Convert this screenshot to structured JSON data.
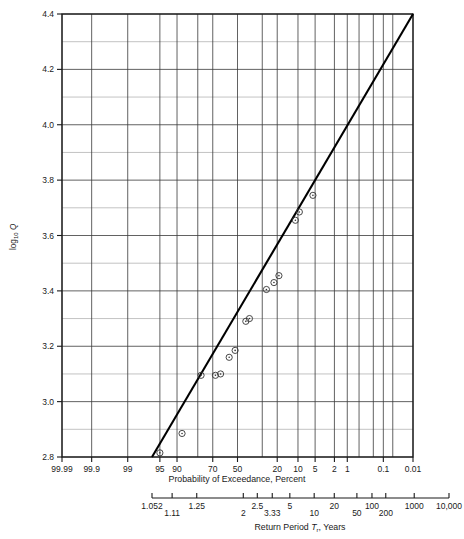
{
  "chart_data": {
    "type": "scatter",
    "title": "",
    "subtitle": "",
    "xlabel": "Probability of Exceedance, Percent",
    "xlabel2": "Return Period T_r, Years",
    "ylabel": "log10 Q",
    "ylabel_base": "log",
    "ylabel_sub": "10",
    "ylabel_var": "Q",
    "grid": true,
    "legend": null,
    "ylim": [
      2.8,
      4.4
    ],
    "y_major_ticks": [
      "2.8",
      "3.0",
      "3.2",
      "3.4",
      "3.6",
      "3.8",
      "4.0",
      "4.2",
      "4.4"
    ],
    "y_minor_ticks": [
      "2.9",
      "3.1",
      "3.3",
      "3.5",
      "3.7",
      "3.9",
      "4.1",
      "4.3"
    ],
    "x_axis_type": "normal-probability",
    "x_tick_labels": [
      "99.99",
      "99.9",
      "99",
      "95",
      "90",
      "70",
      "50",
      "20",
      "10",
      "5",
      "2",
      "1",
      "0.1",
      "0.01"
    ],
    "x_tick_values": [
      99.99,
      99.9,
      99,
      95,
      90,
      70,
      50,
      20,
      10,
      5,
      2,
      1,
      0.1,
      0.01
    ],
    "x_gridline_values": [
      99.99,
      99.9,
      99,
      95,
      90,
      80,
      70,
      50,
      30,
      20,
      10,
      5,
      2,
      1,
      0.5,
      0.2,
      0.1,
      0.05,
      0.01
    ],
    "return_period_labels": [
      "1.052",
      "1.11",
      "1.25",
      "2",
      "2.5",
      "3.33",
      "5",
      "10",
      "20",
      "50",
      "100",
      "200",
      "1000",
      "10,000"
    ],
    "return_period_values": [
      1.052,
      1.11,
      1.25,
      2,
      2.5,
      3.33,
      5,
      10,
      20,
      50,
      100,
      200,
      1000,
      10000
    ],
    "points": [
      {
        "p": 95.0,
        "y": 2.815
      },
      {
        "p": 88.0,
        "y": 2.885
      },
      {
        "p": 78.0,
        "y": 3.095
      },
      {
        "p": 68.0,
        "y": 3.095
      },
      {
        "p": 64.0,
        "y": 3.1
      },
      {
        "p": 57.0,
        "y": 3.16
      },
      {
        "p": 52.0,
        "y": 3.185
      },
      {
        "p": 43.0,
        "y": 3.29
      },
      {
        "p": 40.0,
        "y": 3.3
      },
      {
        "p": 27.0,
        "y": 3.405
      },
      {
        "p": 22.0,
        "y": 3.43
      },
      {
        "p": 19.0,
        "y": 3.455
      },
      {
        "p": 11.0,
        "y": 3.655
      },
      {
        "p": 9.5,
        "y": 3.685
      },
      {
        "p": 5.5,
        "y": 3.745
      }
    ],
    "trend_line": {
      "x1_percent": 96.5,
      "y1": 2.8,
      "x2_percent": 0.01,
      "y2": 4.4
    }
  }
}
